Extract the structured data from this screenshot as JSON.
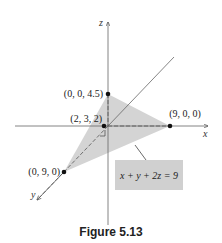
{
  "figure": {
    "caption": "Figure 5.13",
    "equation_label": "x + y + 2z = 9",
    "axes": {
      "x_label": "x",
      "y_label": "y",
      "z_label": "z"
    },
    "points": [
      {
        "id": "z-intercept",
        "label": "(0, 0, 4.5)"
      },
      {
        "id": "x-intercept",
        "label": "(9, 0, 0)"
      },
      {
        "id": "y-intercept",
        "label": "(0, 9, 0)"
      },
      {
        "id": "point-on-plane",
        "label": "(2, 3, 2)"
      }
    ],
    "colors": {
      "plane_fill": "#d4d4d4",
      "label_box_fill": "#d0d0d0",
      "axis": "#555555",
      "point": "#111111"
    }
  }
}
